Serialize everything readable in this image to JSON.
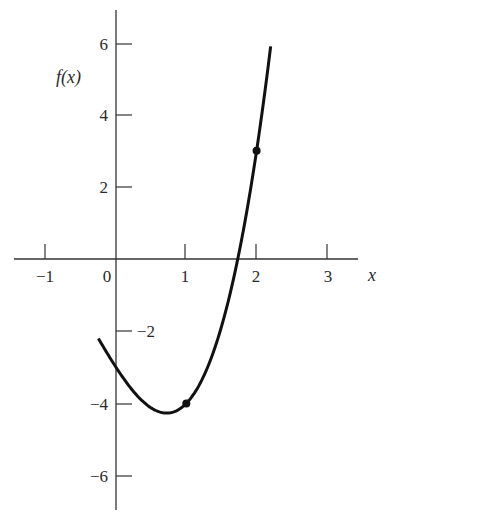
{
  "chart_data": {
    "type": "line",
    "title": "",
    "xlabel": "x",
    "ylabel": "f(x)",
    "xlim": [
      -1.4,
      3.45
    ],
    "ylim": [
      -6.8,
      6.6
    ],
    "grid": false,
    "legend": null,
    "x_ticks": [
      -1,
      0,
      1,
      2,
      3
    ],
    "x_tick_labels": [
      "−1",
      "0",
      "1",
      "2",
      "3"
    ],
    "y_ticks": [
      6,
      4,
      2,
      -2,
      -4,
      -6
    ],
    "y_tick_labels": [
      "6",
      "4",
      "2",
      "−2",
      "−4",
      "−6"
    ],
    "series": [
      {
        "name": "f(x)",
        "function": "x^3 + x^2 - 3x - 3",
        "x_range": [
          -0.25,
          2.2
        ],
        "x": [
          -0.25,
          0,
          0.25,
          0.5,
          0.72,
          1.0,
          1.25,
          1.5,
          1.73,
          2.0,
          2.2
        ],
        "y": [
          -2.2,
          -3.0,
          -3.7,
          -4.13,
          -4.27,
          -4.0,
          -3.22,
          -1.88,
          0.0,
          3.0,
          5.89
        ]
      }
    ],
    "points": [
      {
        "x": 1,
        "y": -4
      },
      {
        "x": 2,
        "y": 3
      }
    ]
  },
  "labels": {
    "x_axis": "x",
    "y_axis": "f(x)",
    "x_ticks": [
      "−1",
      "0",
      "1",
      "2",
      "3"
    ],
    "y_ticks": [
      "6",
      "4",
      "2",
      "−2",
      "−4",
      "−6"
    ]
  }
}
